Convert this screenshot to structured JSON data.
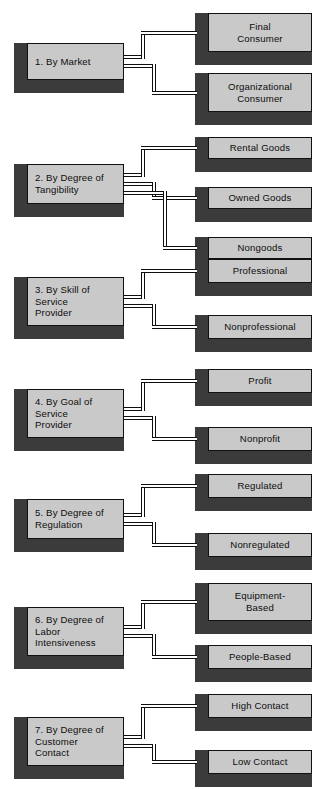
{
  "diagram": {
    "colors": {
      "box_face": "#c9c9c9",
      "box_shadow": "#3b3b3b",
      "outline": "#111111",
      "background": "#ffffff",
      "text": "#0d0d0d"
    },
    "groups": [
      {
        "id": "group-1",
        "category": {
          "number": "1.",
          "label": "By Market"
        },
        "children": [
          {
            "label": "Final\nConsumer"
          },
          {
            "label": "Organizational\nConsumer"
          }
        ]
      },
      {
        "id": "group-2",
        "category": {
          "number": "2.",
          "label": "By Degree of\nTangibility"
        },
        "children": [
          {
            "label": "Rental Goods"
          },
          {
            "label": "Owned Goods"
          },
          {
            "label": "Nongoods"
          }
        ]
      },
      {
        "id": "group-3",
        "category": {
          "number": "3.",
          "label": "By Skill of\nService\nProvider"
        },
        "children": [
          {
            "label": "Professional"
          },
          {
            "label": "Nonprofessional"
          }
        ]
      },
      {
        "id": "group-4",
        "category": {
          "number": "4.",
          "label": "By Goal of\nService\nProvider"
        },
        "children": [
          {
            "label": "Profit"
          },
          {
            "label": "Nonprofit"
          }
        ]
      },
      {
        "id": "group-5",
        "category": {
          "number": "5.",
          "label": "By Degree of\nRegulation"
        },
        "children": [
          {
            "label": "Regulated"
          },
          {
            "label": "Nonregulated"
          }
        ]
      },
      {
        "id": "group-6",
        "category": {
          "number": "6.",
          "label": "By Degree of\nLabor\nIntensiveness"
        },
        "children": [
          {
            "label": "Equipment-\nBased"
          },
          {
            "label": "People-Based"
          }
        ]
      },
      {
        "id": "group-7",
        "category": {
          "number": "7.",
          "label": "By Degree of\nCustomer\nContact"
        },
        "children": [
          {
            "label": "High Contact"
          },
          {
            "label": "Low Contact"
          }
        ]
      }
    ]
  }
}
